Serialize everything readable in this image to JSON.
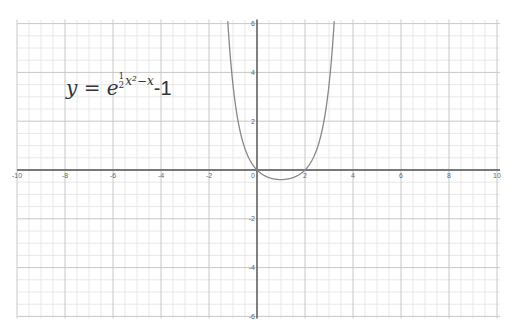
{
  "chart_data": {
    "type": "line",
    "title": "",
    "function": "y = e^(1/2 x^2 - x) - 1",
    "xlabel": "",
    "ylabel": "",
    "xlim": [
      -10,
      10
    ],
    "ylim": [
      -6,
      6
    ],
    "grid": true,
    "major_step": 2,
    "minor_step": 0.5,
    "x_ticks": [
      -10,
      -8,
      -6,
      -4,
      -2,
      0,
      2,
      4,
      6,
      8,
      10
    ],
    "y_ticks": [
      -6,
      -4,
      -2,
      2,
      4,
      6
    ],
    "series": [
      {
        "name": "y = e^(1/2 x^2 - x) - 1",
        "color": "#888888",
        "x": [
          -1.21,
          -1.0,
          -0.75,
          -0.5,
          -0.25,
          0,
          0.25,
          0.5,
          0.75,
          1.0,
          1.25,
          1.5,
          1.75,
          2.0,
          2.25,
          2.5,
          2.75,
          3.0,
          3.21
        ],
        "values": [
          6.0,
          3.48,
          1.67,
          0.87,
          0.33,
          0,
          -0.19,
          -0.31,
          -0.37,
          -0.39,
          -0.37,
          -0.31,
          -0.19,
          0,
          0.33,
          0.87,
          1.67,
          3.48,
          6.0
        ]
      }
    ],
    "annotations": [
      "y = e^(1/2 x^2 - x) - 1"
    ]
  },
  "axis_labels": {
    "x": [
      "-10",
      "-8",
      "-6",
      "-4",
      "-2",
      "0",
      "2",
      "4",
      "6",
      "8",
      "10"
    ],
    "y": [
      "6",
      "4",
      "2",
      "-2",
      "-4",
      "-6"
    ]
  },
  "formula": {
    "lhs": "y = e",
    "num": "1",
    "den": "2",
    "exp_rest": "x²−x",
    "tail": "-1"
  },
  "colors": {
    "axis": "#555555",
    "major_grid": "#c8c8c8",
    "minor_grid": "#e8e8e8",
    "curve": "#888888"
  }
}
